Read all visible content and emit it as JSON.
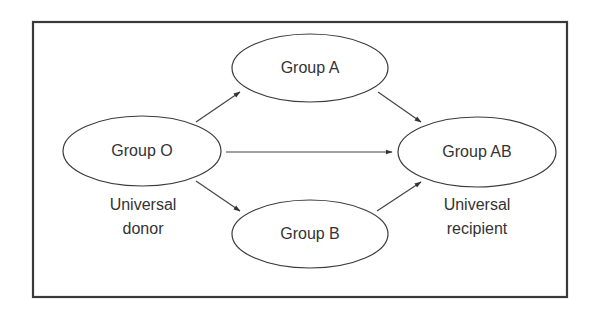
{
  "diagram": {
    "type": "directed-graph",
    "title": "",
    "colors": {
      "frame": "#3a3a3a",
      "stroke": "#3c3c3c",
      "text": "#333333",
      "background": "#ffffff"
    },
    "nodes": [
      {
        "id": "O",
        "label": "Group O",
        "caption": [
          "Universal",
          "donor"
        ]
      },
      {
        "id": "A",
        "label": "Group A",
        "caption": []
      },
      {
        "id": "B",
        "label": "Group B",
        "caption": []
      },
      {
        "id": "AB",
        "label": "Group AB",
        "caption": [
          "Universal",
          "recipient"
        ]
      }
    ],
    "edges": [
      {
        "from": "O",
        "to": "A"
      },
      {
        "from": "O",
        "to": "B"
      },
      {
        "from": "O",
        "to": "AB"
      },
      {
        "from": "A",
        "to": "AB"
      },
      {
        "from": "B",
        "to": "AB"
      }
    ]
  },
  "labels": {
    "group_o": "Group O",
    "group_a": "Group A",
    "group_b": "Group B",
    "group_ab": "Group AB",
    "donor_line1": "Universal",
    "donor_line2": "donor",
    "recipient_line1": "Universal",
    "recipient_line2": "recipient"
  }
}
